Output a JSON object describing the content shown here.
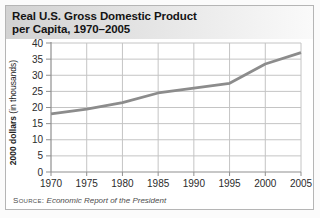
{
  "figure": {
    "title_line1": "Real U.S. Gross Domestic Product",
    "title_line2": "per Capita, 1970–2005",
    "ylabel_main": "2000 dollars",
    "ylabel_sub": " (in thousands)",
    "source_label": "Source:",
    "source_text": "Economic Report of the President"
  },
  "chart_data": {
    "type": "line",
    "title": "Real U.S. Gross Domestic Product per Capita, 1970–2005",
    "xlabel": "",
    "ylabel": "2000 dollars (in thousands)",
    "x": [
      1970,
      1975,
      1980,
      1985,
      1990,
      1995,
      2000,
      2005
    ],
    "values": [
      18,
      19.5,
      21.5,
      24.5,
      26,
      27.5,
      33.5,
      37
    ],
    "ylim": [
      0,
      40
    ],
    "yticks": [
      0,
      5,
      10,
      15,
      20,
      25,
      30,
      35,
      40
    ],
    "grid": true,
    "legend": "none",
    "source": "Economic Report of the President"
  },
  "colors": {
    "header_gradient_left": "#d2d2d2",
    "header_gradient_right": "#fafafa",
    "figure_border": "#b5b5b5",
    "grid": "#c4c4c4",
    "axis": "#8f8f8f",
    "line": "#8c8c8c",
    "title_text": "#141414",
    "tick_text": "#2b2b2b",
    "source_text": "#4d4d4d"
  }
}
